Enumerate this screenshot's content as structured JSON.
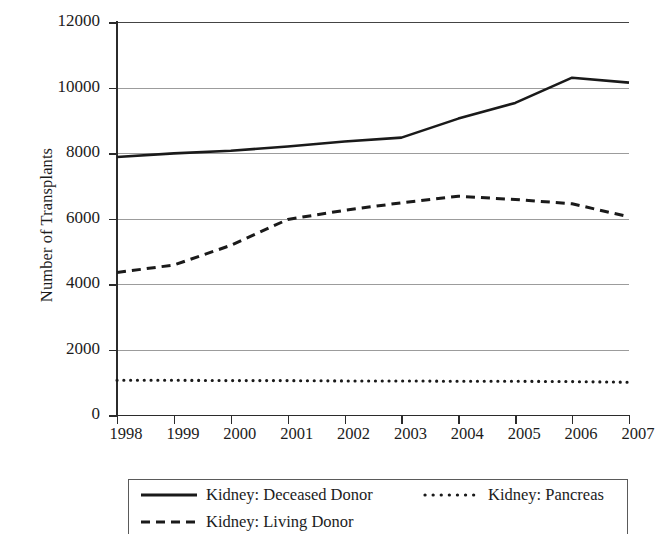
{
  "chart_data": {
    "type": "line",
    "title": "",
    "xlabel": "",
    "ylabel": "Number of Transplants",
    "x": [
      1998,
      1999,
      2000,
      2001,
      2002,
      2003,
      2004,
      2005,
      2006,
      2007
    ],
    "categories": [
      "1998",
      "1999",
      "2000",
      "2001",
      "2002",
      "2003",
      "2004",
      "2005",
      "2006",
      "2007"
    ],
    "xlim": [
      1998,
      2007
    ],
    "ylim": [
      0,
      12000
    ],
    "yticks": [
      0,
      2000,
      4000,
      6000,
      8000,
      10000,
      12000
    ],
    "ytick_labels": [
      "0",
      "2000",
      "4000",
      "6000",
      "8000",
      "10000",
      "12000"
    ],
    "grid": "horizontal",
    "legend_position": "below-plot",
    "series": [
      {
        "name": "Kidney: Deceased Donor",
        "style": "solid",
        "color": "#1a1a1a",
        "values": [
          7880,
          7990,
          8070,
          8200,
          8350,
          8470,
          9050,
          9530,
          10300,
          10150
        ]
      },
      {
        "name": "Kidney: Living Donor",
        "style": "dashed",
        "color": "#1a1a1a",
        "values": [
          4350,
          4580,
          5180,
          5970,
          6250,
          6480,
          6680,
          6580,
          6450,
          6050
        ]
      },
      {
        "name": "Kidney: Pancreas",
        "style": "dotted",
        "color": "#1a1a1a",
        "values": [
          1060,
          1060,
          1050,
          1050,
          1040,
          1040,
          1030,
          1030,
          1020,
          1000
        ]
      }
    ]
  },
  "axes": {
    "y_title": "Number of Transplants",
    "y_ticks": [
      {
        "label": "12000",
        "value": 12000
      },
      {
        "label": "10000",
        "value": 10000
      },
      {
        "label": "8000",
        "value": 8000
      },
      {
        "label": "6000",
        "value": 6000
      },
      {
        "label": "4000",
        "value": 4000
      },
      {
        "label": "2000",
        "value": 2000
      },
      {
        "label": "0",
        "value": 0
      }
    ],
    "x_ticks": [
      {
        "label": "1998"
      },
      {
        "label": "1999"
      },
      {
        "label": "2000"
      },
      {
        "label": "2001"
      },
      {
        "label": "2002"
      },
      {
        "label": "2003"
      },
      {
        "label": "2004"
      },
      {
        "label": "2005"
      },
      {
        "label": "2006"
      },
      {
        "label": "2007"
      }
    ]
  },
  "legend": {
    "entries": [
      {
        "label": "Kidney: Deceased Donor",
        "style": "solid"
      },
      {
        "label": "Kidney: Living Donor",
        "style": "dashed"
      },
      {
        "label": "Kidney: Pancreas",
        "style": "dotted"
      }
    ]
  }
}
